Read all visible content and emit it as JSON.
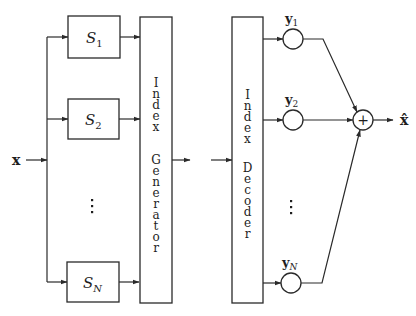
{
  "diagram": {
    "colors": {
      "line": "#2a2a2a",
      "text": "#1e1e1e",
      "background": "#ffffff"
    },
    "input": {
      "label": "x"
    },
    "output": {
      "label": "x̂"
    },
    "encoder_blocks": [
      {
        "label": "S",
        "sub": "1"
      },
      {
        "label": "S",
        "sub": "2"
      },
      {
        "label": "S",
        "sub": "N"
      }
    ],
    "ellipsis": "⋮",
    "index_generator": {
      "words": [
        "Index",
        "Generator"
      ]
    },
    "index_decoder": {
      "words": [
        "Index",
        "Decoder"
      ]
    },
    "codevectors": [
      {
        "label": "y",
        "sub": "1"
      },
      {
        "label": "y",
        "sub": "2"
      },
      {
        "label": "y",
        "sub": "N"
      }
    ],
    "summation": {
      "symbol": "+"
    }
  }
}
